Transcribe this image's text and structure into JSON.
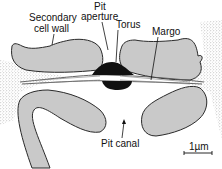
{
  "figure": {
    "labels": {
      "secondary_cell_wall_line1": "Secondary",
      "secondary_cell_wall_line2": "cell wall",
      "pit_aperture_line1": "Pit",
      "pit_aperture_line2": "aperture",
      "torus": "Torus",
      "margo": "Margo",
      "pit_canal": "Pit canal"
    },
    "scale_bar": {
      "label": "1µm",
      "length_value": 1,
      "unit": "µm"
    },
    "colors": {
      "cell_wall_fill": "#c9c9c9",
      "outline": "#2a2a2a",
      "torus": "#111111",
      "background": "#ffffff",
      "middle_lamella_stipple": "#8a8a8a"
    }
  }
}
